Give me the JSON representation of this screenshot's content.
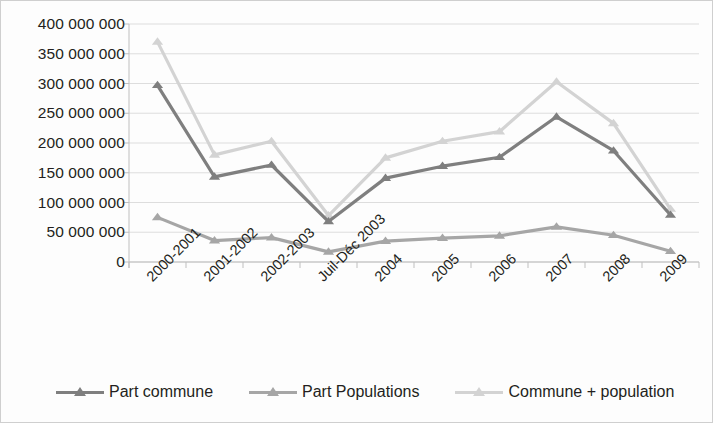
{
  "chart_data": {
    "type": "line",
    "title": "",
    "subtitle": "",
    "xlabel": "",
    "ylabel": "",
    "ylim": [
      0,
      400000000
    ],
    "ytick_step": 50000000,
    "grid": true,
    "legend_position": "bottom",
    "categories": [
      "2000-2001",
      "2001-2002",
      "2002-2003",
      "Juil-Déc 2003",
      "2004",
      "2005",
      "2006",
      "2007",
      "2008",
      "2009"
    ],
    "ytick_labels": [
      "400 000 000",
      "350 000 000",
      "300 000 000",
      "250 000 000",
      "200 000 000",
      "150 000 000",
      "100 000 000",
      "50 000 000",
      "0"
    ],
    "ytick_values": [
      400000000,
      350000000,
      300000000,
      250000000,
      200000000,
      150000000,
      100000000,
      50000000,
      0
    ],
    "series": [
      {
        "name": "Part commune",
        "color": "#7f7f7f",
        "marker": "triangle",
        "values": [
          297000000,
          143000000,
          163000000,
          68000000,
          141000000,
          161000000,
          176000000,
          244000000,
          187000000,
          79000000
        ]
      },
      {
        "name": "Part Populations",
        "color": "#a6a6a6",
        "marker": "triangle",
        "values": [
          75000000,
          36000000,
          41000000,
          17000000,
          35000000,
          40000000,
          44000000,
          59000000,
          45000000,
          18000000
        ]
      },
      {
        "name": "Commune + population",
        "color": "#d3d3d3",
        "marker": "triangle",
        "values": [
          370000000,
          180000000,
          203000000,
          78000000,
          175000000,
          203000000,
          219000000,
          303000000,
          233000000,
          89000000
        ]
      }
    ]
  },
  "axes": {
    "plot_left": 128,
    "plot_right": 698,
    "plot_top": 23,
    "plot_bottom": 261,
    "axis_color": "#bfbfbf",
    "grid_color": "#d9d9d9"
  },
  "legend": {
    "items": [
      {
        "label": "Part commune",
        "color": "#7f7f7f"
      },
      {
        "label": "Part Populations",
        "color": "#a6a6a6"
      },
      {
        "label": "Commune + population",
        "color": "#d3d3d3"
      }
    ]
  }
}
